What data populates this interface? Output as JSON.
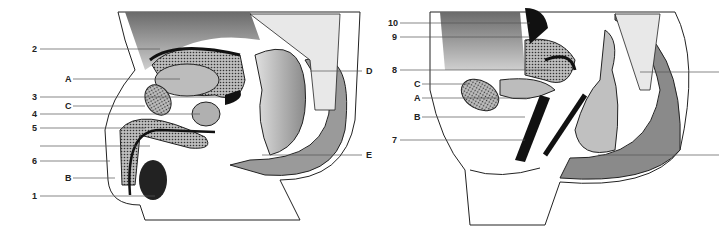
{
  "diagrams": {
    "male": {
      "labels": [
        {
          "text": "2",
          "x": 32,
          "y": 49
        },
        {
          "text": "A",
          "x": 65,
          "y": 79
        },
        {
          "text": "3",
          "x": 32,
          "y": 97
        },
        {
          "text": "C",
          "x": 65,
          "y": 106
        },
        {
          "text": "4",
          "x": 32,
          "y": 114
        },
        {
          "text": "5",
          "x": 32,
          "y": 128
        },
        {
          "text": "",
          "x": 32,
          "y": 146
        },
        {
          "text": "6",
          "x": 32,
          "y": 161
        },
        {
          "text": "B",
          "x": 65,
          "y": 178
        },
        {
          "text": "1",
          "x": 32,
          "y": 196
        },
        {
          "text": "D",
          "x": 366,
          "y": 71
        },
        {
          "text": "E",
          "x": 366,
          "y": 155
        }
      ]
    },
    "female": {
      "labels": [
        {
          "text": "10",
          "x": 388,
          "y": 23
        },
        {
          "text": "9",
          "x": 392,
          "y": 37
        },
        {
          "text": "8",
          "x": 392,
          "y": 70
        },
        {
          "text": "C",
          "x": 414,
          "y": 84
        },
        {
          "text": "A",
          "x": 414,
          "y": 98
        },
        {
          "text": "B",
          "x": 414,
          "y": 117
        },
        {
          "text": "7",
          "x": 392,
          "y": 140
        }
      ]
    }
  }
}
